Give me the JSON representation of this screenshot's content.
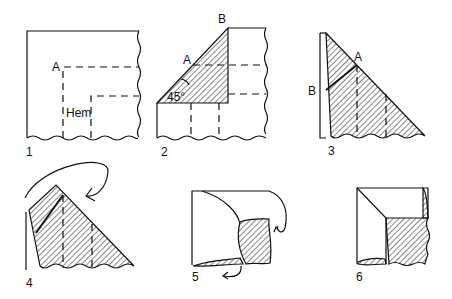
{
  "steps": [
    {
      "number": "1",
      "labels": [
        "A",
        "Hem"
      ]
    },
    {
      "number": "2",
      "labels": [
        "B",
        "A",
        "45°"
      ]
    },
    {
      "number": "3",
      "labels": [
        "A",
        "B"
      ]
    },
    {
      "number": "4",
      "labels": []
    },
    {
      "number": "5",
      "labels": []
    },
    {
      "number": "6",
      "labels": []
    }
  ],
  "colors": {
    "ink": "#111111",
    "paper": "#ffffff"
  }
}
